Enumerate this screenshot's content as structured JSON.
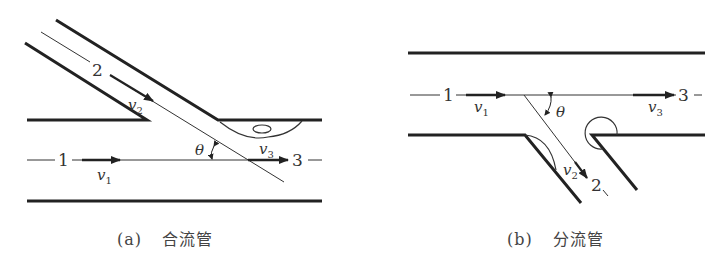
{
  "figures": [
    {
      "id": "a",
      "caption_label": "(a)",
      "caption_text": "合流管",
      "labels": {
        "inlet_main": "1",
        "inlet_branch": "2",
        "outlet": "3",
        "angle": "θ"
      },
      "velocities": {
        "v1": "v",
        "v1_sub": "1",
        "v2": "v",
        "v2_sub": "2",
        "v3": "v",
        "v3_sub": "3"
      }
    },
    {
      "id": "b",
      "caption_label": "(b)",
      "caption_text": "分流管",
      "labels": {
        "inlet_main": "1",
        "outlet_branch": "2",
        "outlet": "3",
        "angle": "θ"
      },
      "velocities": {
        "v1": "v",
        "v1_sub": "1",
        "v2": "v",
        "v2_sub": "2",
        "v3": "v",
        "v3_sub": "3"
      }
    }
  ]
}
